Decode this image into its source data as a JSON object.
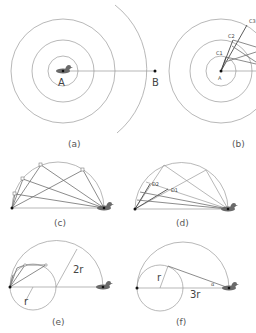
{
  "figure": {
    "panels": [
      {
        "id": "a",
        "caption": "(a)",
        "labels": {
          "center": "A",
          "target": "B"
        }
      },
      {
        "id": "b",
        "caption": "(b)",
        "labels": {
          "center": "A",
          "points": [
            "C1",
            "C2",
            "C3"
          ]
        }
      },
      {
        "id": "c",
        "caption": "(c)"
      },
      {
        "id": "d",
        "caption": "(d)",
        "labels": {
          "points": [
            "D1",
            "D2"
          ]
        }
      },
      {
        "id": "e",
        "caption": "(e)",
        "labels": {
          "small_radius": "r",
          "large_radius": "2r"
        }
      },
      {
        "id": "f",
        "caption": "(f)",
        "labels": {
          "small_radius": "r",
          "distance": "3r",
          "angle": "α"
        }
      }
    ],
    "icons": {
      "duck": "duck-icon",
      "point": "dot-icon"
    },
    "colors": {
      "line": "#9a9a9a",
      "dark_line": "#4a4a4a",
      "duck": "#555555",
      "text": "#444444"
    }
  }
}
